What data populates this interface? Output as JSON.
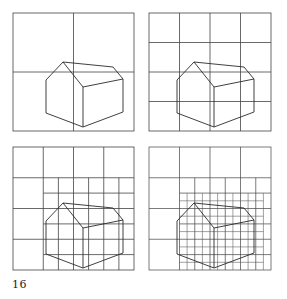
{
  "figure": {
    "panels": [
      {
        "id": "panel-1",
        "grid": "2x2"
      },
      {
        "id": "panel-2",
        "grid": "4x4"
      },
      {
        "id": "panel-3",
        "grid": "4x4 with half subdivisions around house"
      },
      {
        "id": "panel-4",
        "grid": "4x4 with quarter subdivisions around house"
      }
    ],
    "line_color": "#333333"
  },
  "page": {
    "number": "16"
  }
}
